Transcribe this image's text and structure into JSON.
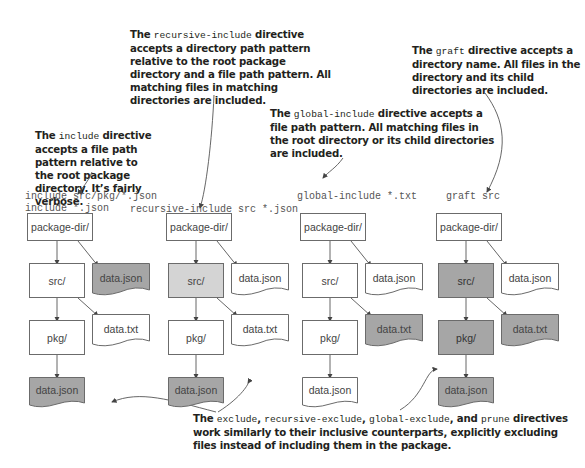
{
  "annotations": {
    "include": {
      "pre": "The ",
      "code": "include",
      "post": " directive accepts a file path pattern relative to the root package directory. It’s fairly verbose."
    },
    "recursive_include": {
      "pre": "The ",
      "code": "recursive-include",
      "post": " directive accepts a directory path pattern relative to the root package directory and a file path pattern. All matching files in matching directories are included."
    },
    "global_include": {
      "pre": "The ",
      "code": "global-include",
      "post": " directive accepts a file path pattern. All matching files in the root directory or its child directories are included."
    },
    "graft": {
      "pre": "The ",
      "code": "graft",
      "post": " directive accepts a directory name. All files in the directory and its child directories are included."
    },
    "exclude": {
      "pre": "The ",
      "code1": "exclude",
      "sep1": ", ",
      "code2": "recursive-exclude",
      "sep2": ", ",
      "code3": "global-exclude",
      "sep3": ", and ",
      "code4": "prune",
      "post": " directives work similarly to their inclusive counterparts, explicitly excluding files instead of including them in the package."
    }
  },
  "columns": [
    {
      "command": "include src/pkg/*.json\ninclude *.json",
      "root": "package-dir/",
      "src": "src/",
      "pkg": "pkg/",
      "root_file": "data.json",
      "src_file": "data.txt",
      "pkg_file": "data.json",
      "highlight": {
        "root": false,
        "src": false,
        "pkg": false,
        "root_file": true,
        "src_file": false,
        "pkg_file": true
      }
    },
    {
      "command": "recursive-include src *.json",
      "root": "package-dir/",
      "src": "src/",
      "pkg": "pkg/",
      "root_file": "data.json",
      "src_file": "data.txt",
      "pkg_file": "data.json",
      "highlight": {
        "root": false,
        "src": "light",
        "pkg": false,
        "root_file": false,
        "src_file": false,
        "pkg_file": true
      }
    },
    {
      "command": "global-include *.txt",
      "root": "package-dir/",
      "src": "src/",
      "pkg": "pkg/",
      "root_file": "data.json",
      "src_file": "data.txt",
      "pkg_file": "data.json",
      "highlight": {
        "root": false,
        "src": false,
        "pkg": false,
        "root_file": false,
        "src_file": true,
        "pkg_file": false
      }
    },
    {
      "command": "graft src",
      "root": "package-dir/",
      "src": "src/",
      "pkg": "pkg/",
      "root_file": "data.json",
      "src_file": "data.txt",
      "pkg_file": "data.json",
      "highlight": {
        "root": false,
        "src": true,
        "pkg": true,
        "root_file": false,
        "src_file": true,
        "pkg_file": true
      }
    }
  ],
  "colors": {
    "highlight": "#a6a6a6",
    "light_highlight": "#d4d4d4",
    "border": "#6b6b6b",
    "text": "#231f20"
  }
}
